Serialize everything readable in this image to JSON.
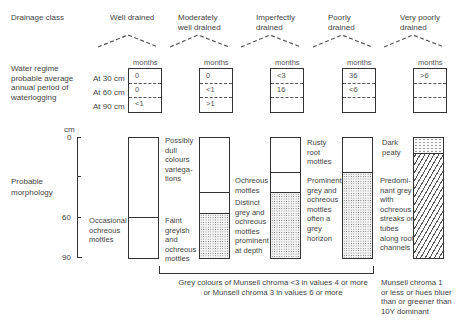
{
  "row_labels": {
    "drainage_class": "Drainage class",
    "water_regime": "Water regime probable average annual period of waterlogging",
    "water_regime_lines": [
      "Water regime",
      "probable average",
      "annual period of",
      "waterlogging"
    ],
    "morphology_lines": [
      "Probable",
      "morphology"
    ]
  },
  "depth_labels": [
    "At 30 cm",
    "At 60 cm",
    "At 90 cm"
  ],
  "months_label": "months",
  "axis": {
    "unit": "cm",
    "ticks": [
      "0",
      "60",
      "90"
    ]
  },
  "classes": [
    {
      "name_lines": [
        "Well drained"
      ],
      "regime": [
        "0",
        "0",
        "<1"
      ],
      "morphology_notes": []
    },
    {
      "name_lines": [
        "Moderately",
        "well drained"
      ],
      "regime": [
        "0",
        "<1",
        ">1"
      ],
      "morphology_notes": []
    },
    {
      "name_lines": [
        "Imperfectly",
        "drained"
      ],
      "regime": [
        "<3",
        "16",
        ""
      ],
      "morphology_notes": []
    },
    {
      "name_lines": [
        "Poorly",
        "drained"
      ],
      "regime": [
        "36",
        "<6",
        ""
      ],
      "morphology_notes": []
    },
    {
      "name_lines": [
        "Very poorly",
        "drained"
      ],
      "regime": [
        ">6",
        "",
        ""
      ],
      "morphology_notes": []
    }
  ],
  "descriptions": {
    "well_occasional": [
      "Occasional",
      "ochreous",
      "mottles"
    ],
    "mod_possibly": [
      "Possibly",
      "dull",
      "colours",
      "variega-",
      "tions"
    ],
    "mod_faint": [
      "Faint",
      "greyish",
      "and",
      "ochreous",
      "mottles"
    ],
    "imp_ochreous": [
      "Ochreous",
      "mottles"
    ],
    "imp_distinct": [
      "Distinct",
      "grey and",
      "ochreous",
      "mottles",
      "prominent",
      "at depth"
    ],
    "poor_rusty": [
      "Rusty",
      "root",
      "mottles"
    ],
    "poor_prominent": [
      "Prominent",
      "grey and",
      "ochreous",
      "mottles",
      "often a",
      "grey",
      "horizon"
    ],
    "vpoor_dark": [
      "Dark",
      "peaty"
    ],
    "vpoor_predominant": [
      "Predomi-",
      "nant grey",
      "with",
      "ochreous",
      "streaks or",
      "tubes",
      "along root",
      "channels"
    ]
  },
  "footnotes": {
    "grey_colours": [
      "Grey colours of Munsell chroma <3 in values 4 or more",
      "or Munsell chroma 3 in values 6 or more"
    ],
    "munsell": [
      "Munsell chroma 1",
      "or less or hues bluer",
      "than or greener than",
      "10Y dominant"
    ]
  }
}
